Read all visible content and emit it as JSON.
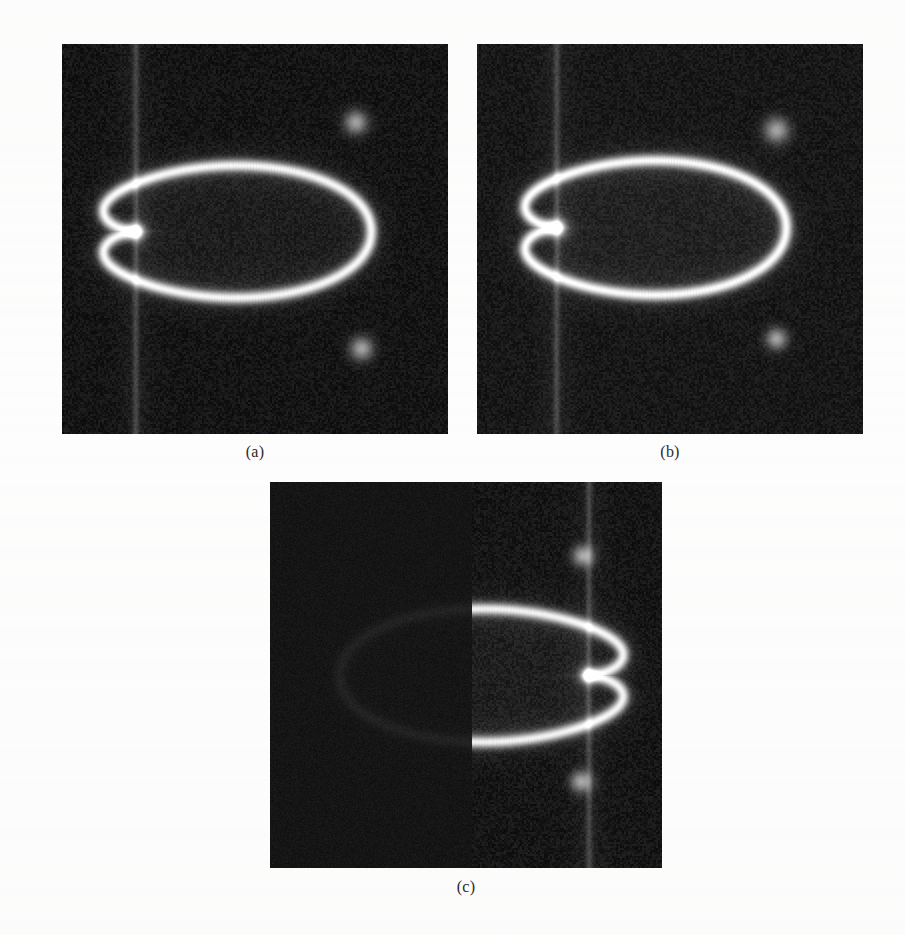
{
  "figure": {
    "background_color": "#fdfdfd",
    "caption_color": "#2b2b2b",
    "panels": [
      {
        "id": "panel-a",
        "caption": "(a)",
        "x": 62,
        "y": 44,
        "width": 386,
        "height": 390,
        "caption_x": 255,
        "caption_y": 443,
        "noise_floor_color": "#151515",
        "field_color": "#1e1e1e",
        "caustic_color": "#e8e8e8",
        "mirrored": false,
        "half_masked": false,
        "cusp_x_frac": 0.19,
        "cusp_y_frac": 0.48,
        "apex_right_frac": 0.8,
        "top_frac": 0.185,
        "bottom_frac": 0.8,
        "hotspots": [
          {
            "x_frac": 0.76,
            "y_frac": 0.2,
            "r_frac": 0.035
          },
          {
            "x_frac": 0.775,
            "y_frac": 0.78,
            "r_frac": 0.035
          },
          {
            "x_frac": 0.19,
            "y_frac": 0.48,
            "r_frac": 0.028
          }
        ],
        "vertical_streak_x_frac": 0.19
      },
      {
        "id": "panel-b",
        "caption": "(b)",
        "x": 477,
        "y": 44,
        "width": 386,
        "height": 390,
        "caption_x": 670,
        "caption_y": 443,
        "noise_floor_color": "#181818",
        "field_color": "#222222",
        "caustic_color": "#ededed",
        "mirrored": false,
        "half_masked": false,
        "cusp_x_frac": 0.205,
        "cusp_y_frac": 0.47,
        "apex_right_frac": 0.8,
        "top_frac": 0.175,
        "bottom_frac": 0.8,
        "hotspots": [
          {
            "x_frac": 0.775,
            "y_frac": 0.22,
            "r_frac": 0.038
          },
          {
            "x_frac": 0.775,
            "y_frac": 0.755,
            "r_frac": 0.032
          },
          {
            "x_frac": 0.205,
            "y_frac": 0.47,
            "r_frac": 0.03
          }
        ],
        "vertical_streak_x_frac": 0.205
      },
      {
        "id": "panel-c",
        "caption": "(c)",
        "x": 270,
        "y": 482,
        "width": 392,
        "height": 386,
        "caption_x": 466,
        "caption_y": 878,
        "noise_floor_color": "#161616",
        "field_color": "#1f1f1f",
        "caustic_color": "#e3e3e3",
        "mirrored": true,
        "half_masked": true,
        "mask_right_frac": 0.515,
        "cusp_x_frac": 0.815,
        "cusp_y_frac": 0.5,
        "apex_right_frac": 0.18,
        "top_frac": 0.175,
        "bottom_frac": 0.8,
        "hotspots": [
          {
            "x_frac": 0.8,
            "y_frac": 0.19,
            "r_frac": 0.032
          },
          {
            "x_frac": 0.795,
            "y_frac": 0.775,
            "r_frac": 0.032
          },
          {
            "x_frac": 0.815,
            "y_frac": 0.5,
            "r_frac": 0.026
          }
        ],
        "vertical_streak_x_frac": 0.815
      }
    ]
  },
  "chart_data": {
    "type": "heatmap",
    "title": "",
    "xlabel": "",
    "ylabel": "",
    "panel_labels": [
      "(a)",
      "(b)",
      "(c)"
    ],
    "colormap": "gray",
    "value_range": [
      0,
      1
    ],
    "grid": false,
    "legend": "none",
    "panels": [
      {
        "label": "(a)",
        "shape": "cardioid-caustic",
        "cusp_position": [
          0.19,
          0.48
        ],
        "background_level": 0.09,
        "interior_level": 0.12,
        "caustic_peak_level": 0.91,
        "masked_region": "none"
      },
      {
        "label": "(b)",
        "shape": "cardioid-caustic",
        "cusp_position": [
          0.205,
          0.47
        ],
        "background_level": 0.11,
        "interior_level": 0.14,
        "caustic_peak_level": 0.93,
        "masked_region": "none"
      },
      {
        "label": "(c)",
        "shape": "cardioid-caustic-mirrored",
        "cusp_position": [
          0.815,
          0.5
        ],
        "background_level": 0.09,
        "interior_level": 0.13,
        "caustic_peak_level": 0.89,
        "masked_region": "left-half"
      }
    ]
  }
}
